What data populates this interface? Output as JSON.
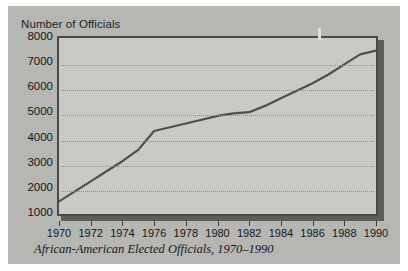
{
  "figure": {
    "background_color": "#b6b6b3",
    "plot_background_color": "#c9c9c6",
    "frame_color": "#4a4a49",
    "line_color": "#4f4f52",
    "grid_color": "#8e8e8b"
  },
  "chart_data": {
    "type": "line",
    "title": "Number of Officials",
    "caption": "African-American Elected Officials, 1970–1990",
    "xlabel": "",
    "ylabel": "Number of Officials",
    "xlim": [
      1970,
      1990
    ],
    "ylim": [
      1000,
      8000
    ],
    "grid": true,
    "legend": "none",
    "y_ticks": [
      8000,
      7000,
      6000,
      5000,
      4000,
      3000,
      2000,
      1000
    ],
    "y_tick_labels": [
      "8000",
      "7000",
      "6000",
      "5000",
      "4000",
      "3000",
      "2000",
      "1000"
    ],
    "x_ticks": [
      1970,
      1972,
      1974,
      1976,
      1978,
      1980,
      1982,
      1984,
      1986,
      1988,
      1990
    ],
    "x_tick_labels": [
      "1970",
      "1972",
      "1974",
      "1976",
      "1978",
      "1980",
      "1982",
      "1984",
      "1986",
      "1988",
      "1990"
    ],
    "x": [
      1970,
      1971,
      1972,
      1973,
      1974,
      1975,
      1976,
      1977,
      1978,
      1979,
      1980,
      1981,
      1982,
      1983,
      1984,
      1985,
      1986,
      1987,
      1988,
      1989,
      1990
    ],
    "values": [
      1500,
      1900,
      2300,
      2700,
      3100,
      3550,
      4300,
      4450,
      4600,
      4750,
      4900,
      5000,
      5050,
      5300,
      5600,
      5900,
      6200,
      6550,
      6950,
      7350,
      7500
    ],
    "series": [
      {
        "name": "African-American Elected Officials",
        "values": [
          1500,
          1900,
          2300,
          2700,
          3100,
          3550,
          4300,
          4450,
          4600,
          4750,
          4900,
          5000,
          5050,
          5300,
          5600,
          5900,
          6200,
          6550,
          6950,
          7350,
          7500
        ]
      }
    ]
  }
}
